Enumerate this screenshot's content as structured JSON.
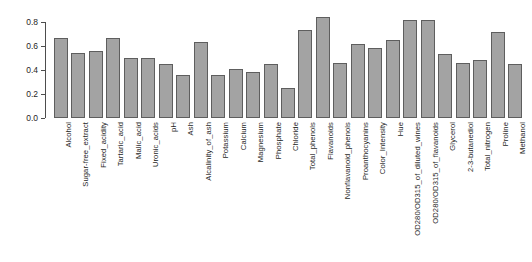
{
  "chart_data": {
    "type": "bar",
    "title": "",
    "subtitle": "",
    "xlabel": "",
    "ylabel": "",
    "ylim": [
      0.0,
      0.9
    ],
    "grid": false,
    "legend": null,
    "y_ticks": [
      "0.0",
      "0.2",
      "0.4",
      "0.6",
      "0.8"
    ],
    "y_tick_values": [
      0.0,
      0.2,
      0.4,
      0.6,
      0.8
    ],
    "bar_color": "#a3a3a3",
    "bar_border_color": "#5e5e5e",
    "axis_color": "#4d4d4d",
    "categories": [
      "Alcohol",
      "Sugar-free_extract",
      "Fixed_acidity",
      "Tartaric_acid",
      "Malic_acid",
      "Uronic_acids",
      "pH",
      "Ash",
      "Alcalinity_of_ash",
      "Potassium",
      "Calcium",
      "Magnesium",
      "Phosphate",
      "Chloride",
      "Total_phenols",
      "Flavanoids",
      "Nonflavanoid_phenols",
      "Proanthocyanins",
      "Color_Intensity",
      "Hue",
      "OD280/OD315_of_diluted_wines",
      "OD280/OD315_of_flavanoids",
      "Glycerol",
      "2-3-butanediol",
      "Total_nitrogen",
      "Proline",
      "Methanol"
    ],
    "values": [
      0.67,
      0.54,
      0.56,
      0.67,
      0.5,
      0.5,
      0.45,
      0.36,
      0.63,
      0.36,
      0.41,
      0.38,
      0.45,
      0.25,
      0.73,
      0.84,
      0.46,
      0.62,
      0.58,
      0.65,
      0.82,
      0.82,
      0.53,
      0.46,
      0.48,
      0.72,
      0.45
    ]
  }
}
